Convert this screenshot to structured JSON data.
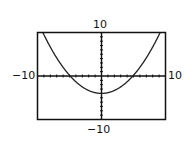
{
  "chart_data": {
    "type": "line",
    "title": "",
    "xlabel": "",
    "ylabel": "",
    "xlim": [
      -10,
      10
    ],
    "ylim": [
      -10,
      10
    ],
    "x_tick_step": 1,
    "y_tick_step": 1,
    "grid": false,
    "window_labels": {
      "ymax": "10",
      "ymin": "-10",
      "xmin": "-10",
      "xmax": "10"
    },
    "series": [
      {
        "name": "parabola",
        "equation": "y = x^2/6 - 4",
        "vertex": [
          0,
          -4
        ],
        "x_intercepts": [
          -4.9,
          4.9
        ],
        "x": [
          -8.5,
          -8,
          -7,
          -6,
          -5,
          -4.9,
          -4,
          -3,
          -2,
          -1,
          0,
          1,
          2,
          3,
          4,
          4.9,
          5,
          6,
          7,
          8,
          8.5
        ],
        "values": [
          8.04,
          6.67,
          4.17,
          2.0,
          0.17,
          0.0,
          -1.33,
          -2.5,
          -3.33,
          -3.83,
          -4.0,
          -3.83,
          -3.33,
          -2.5,
          -1.33,
          0.0,
          0.17,
          2.0,
          4.17,
          6.67,
          8.04
        ]
      }
    ]
  },
  "labels": {
    "top": "10",
    "bottom": "−10",
    "left": "−10",
    "right": "10"
  }
}
